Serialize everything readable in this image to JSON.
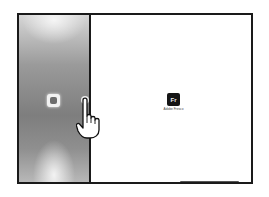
{
  "left_pane": {
    "app": {
      "icon": "app-icon",
      "label": "Ai"
    }
  },
  "right_pane": {
    "app": {
      "icon_text": "Fr",
      "label": "Adobe Fresco"
    }
  },
  "gesture": {
    "icon": "hand-pointer-icon",
    "target": "split-view-divider"
  }
}
